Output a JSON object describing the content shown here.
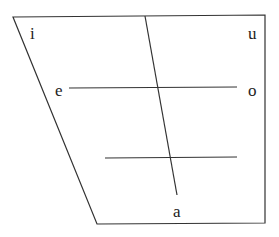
{
  "diagram": {
    "type": "vowel-trapezoid",
    "line_color": "#333333",
    "vowels": {
      "i": "i",
      "u": "u",
      "e": "e",
      "o": "o",
      "a": "a"
    }
  }
}
